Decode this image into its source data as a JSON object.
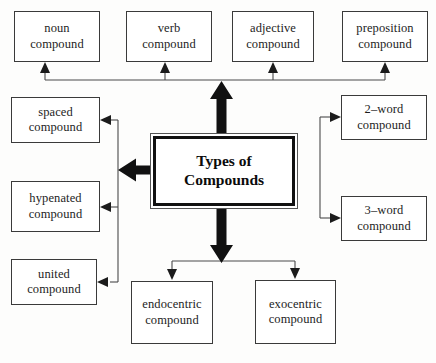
{
  "diagram": {
    "title": "Types of Compounds",
    "center": {
      "label_line1": "Types of",
      "label_line2": "Compounds"
    },
    "colors": {
      "background": "#fdfdfc",
      "box_border": "#3a3a3a",
      "center_border": "#111111",
      "arrow_fill": "#111111",
      "connector_line": "#4a4a4a",
      "text": "#1d1d1d"
    },
    "branches": [
      {
        "direction": "up",
        "arrow_style": "thick-block",
        "nodes": [
          {
            "line1": "noun",
            "line2": "compound"
          },
          {
            "line1": "verb",
            "line2": "compound"
          },
          {
            "line1": "adjective",
            "line2": "compound"
          },
          {
            "line1": "preposition",
            "line2": "compound"
          }
        ]
      },
      {
        "direction": "left",
        "arrow_style": "thick-block",
        "nodes": [
          {
            "line1": "spaced",
            "line2": "compound"
          },
          {
            "line1": "hypenated",
            "line2": "compound"
          },
          {
            "line1": "united",
            "line2": "compound"
          }
        ]
      },
      {
        "direction": "right",
        "arrow_style": "thick-block",
        "nodes": [
          {
            "line1": "2–word",
            "line2": "compound"
          },
          {
            "line1": "3–word",
            "line2": "compound"
          }
        ]
      },
      {
        "direction": "down",
        "arrow_style": "thick-block",
        "nodes": [
          {
            "line1": "endocentric",
            "line2": "compound"
          },
          {
            "line1": "exocentric",
            "line2": "compound"
          }
        ]
      }
    ]
  }
}
